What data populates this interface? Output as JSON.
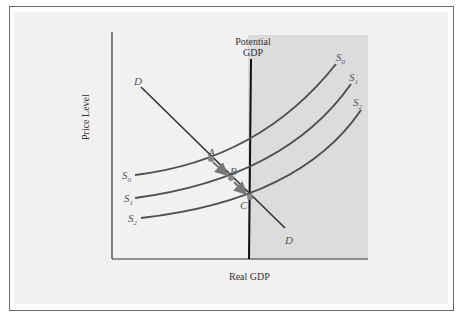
{
  "figure": {
    "xlabel": "Real GDP",
    "ylabel": "Price Level",
    "potential_label_line1": "Potential",
    "potential_label_line2": "GDP",
    "demand_label": "D",
    "points": {
      "A": "A",
      "B": "B",
      "C": "C"
    },
    "supply_labels": {
      "S0": "S",
      "S0_sub": "0",
      "S1": "S",
      "S1_sub": "1",
      "S2": "S",
      "S2_sub": "2"
    }
  },
  "colors": {
    "curve": "#505050",
    "shaded_region": "#dcdcdc",
    "panel": "#f1f1f1",
    "arrow": "#777777",
    "point": "#888888"
  }
}
